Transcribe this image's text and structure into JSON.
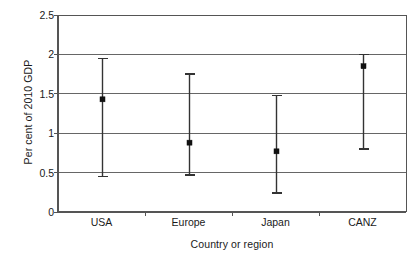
{
  "chart_data": {
    "type": "scatter",
    "title": "",
    "xlabel": "Country or region",
    "ylabel": "Per cent of 2010 GDP",
    "categories": [
      "USA",
      "Europe",
      "Japan",
      "CANZ"
    ],
    "ytick_labels": [
      "0",
      "0.5",
      "1",
      "1.5",
      "2",
      "2.5"
    ],
    "ytick_values": [
      0,
      0.5,
      1,
      1.5,
      2,
      2.5
    ],
    "ylim": [
      0,
      2.5
    ],
    "grid": "horizontal",
    "legend": "none",
    "series": [
      {
        "name": "Central estimate with range",
        "values": [
          1.43,
          0.88,
          0.77,
          1.85
        ],
        "lower": [
          0.45,
          0.47,
          0.24,
          0.8
        ],
        "upper": [
          1.95,
          1.75,
          1.48,
          2.0
        ]
      }
    ],
    "points": [
      {
        "category": "USA",
        "value": 1.43,
        "lower": 0.45,
        "upper": 1.95
      },
      {
        "category": "Europe",
        "value": 0.88,
        "lower": 0.47,
        "upper": 1.75
      },
      {
        "category": "Japan",
        "value": 0.77,
        "lower": 0.24,
        "upper": 1.48
      },
      {
        "category": "CANZ",
        "value": 1.85,
        "lower": 0.8,
        "upper": 2.0
      }
    ],
    "colors": {
      "axis": "#555555",
      "grid": "#666666",
      "marker": "#111111",
      "errorbar": "#333333",
      "background": "#ffffff"
    }
  }
}
